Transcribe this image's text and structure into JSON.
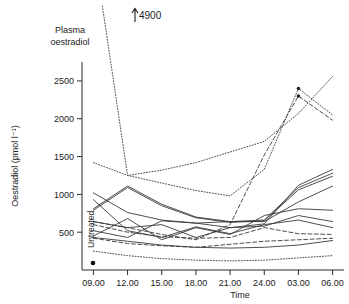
{
  "figure": {
    "title_line1": "Plasma",
    "title_line2": "oestradiol",
    "annotation_offscale": "4900",
    "untreated_label": "Untreated"
  },
  "chart_data": {
    "type": "line",
    "title": "Plasma oestradiol",
    "xlabel": "Time",
    "ylabel": "Oestradiol (pmol l⁻¹)",
    "x_tick_labels": [
      "09.00",
      "12.00",
      "15.00",
      "18.00",
      "21.00",
      "24.00",
      "03.00",
      "06.00"
    ],
    "x": [
      9,
      12,
      15,
      18,
      21,
      24,
      27,
      30
    ],
    "y_tick_labels": [
      "500",
      "1000",
      "1500",
      "2000",
      "2500"
    ],
    "y_ticks": [
      500,
      1000,
      1500,
      2000,
      2500
    ],
    "ylim": [
      0,
      2750
    ],
    "xlim": [
      8,
      31
    ],
    "grid": false,
    "legend": "none",
    "annotations": [
      {
        "text": "4900",
        "x": 12,
        "y": 2740,
        "note": "off-scale peak value for steeply falling dotted series"
      },
      {
        "text": "Untreated",
        "x": 8.2,
        "y": 420,
        "note": "rotated label with single marker point at baseline"
      }
    ],
    "untreated_point": {
      "x": 8.2,
      "y": 70
    },
    "series": [
      {
        "name": "subject-1",
        "style": "dotted",
        "values": [
          4900,
          1250,
          1320,
          1420,
          1560,
          1700,
          2070,
          2560
        ]
      },
      {
        "name": "subject-2",
        "style": "dotted",
        "values": [
          1420,
          1250,
          1150,
          1050,
          980,
          1330,
          2400,
          2050
        ]
      },
      {
        "name": "subject-3",
        "style": "dashed",
        "values": [
          640,
          560,
          470,
          400,
          600,
          1520,
          2300,
          1980
        ]
      },
      {
        "name": "subject-4",
        "style": "solid",
        "values": [
          1020,
          760,
          660,
          620,
          560,
          610,
          1120,
          1330
        ]
      },
      {
        "name": "subject-5",
        "style": "solid",
        "values": [
          810,
          1110,
          870,
          700,
          640,
          660,
          1090,
          1280
        ]
      },
      {
        "name": "subject-6",
        "style": "solid",
        "values": [
          790,
          1090,
          850,
          690,
          630,
          650,
          1060,
          1240
        ]
      },
      {
        "name": "subject-7",
        "style": "solid",
        "values": [
          520,
          430,
          650,
          620,
          640,
          640,
          900,
          1110
        ]
      },
      {
        "name": "subject-8",
        "style": "solid",
        "values": [
          450,
          680,
          400,
          560,
          470,
          720,
          810,
          790
        ]
      },
      {
        "name": "subject-9",
        "style": "solid",
        "values": [
          640,
          560,
          600,
          430,
          560,
          580,
          720,
          640
        ]
      },
      {
        "name": "subject-10",
        "style": "dashed",
        "values": [
          600,
          500,
          440,
          420,
          430,
          560,
          480,
          470
        ]
      },
      {
        "name": "subject-11",
        "style": "dashed",
        "values": [
          420,
          350,
          320,
          300,
          340,
          380,
          400,
          420
        ]
      },
      {
        "name": "subject-12",
        "style": "solid",
        "values": [
          430,
          380,
          330,
          300,
          290,
          300,
          330,
          390
        ]
      },
      {
        "name": "subject-13",
        "style": "dotted",
        "values": [
          250,
          190,
          150,
          130,
          120,
          130,
          160,
          190
        ]
      },
      {
        "name": "subject-14",
        "style": "solid",
        "values": [
          930,
          520,
          430,
          570,
          480,
          600,
          660,
          560
        ]
      }
    ]
  }
}
